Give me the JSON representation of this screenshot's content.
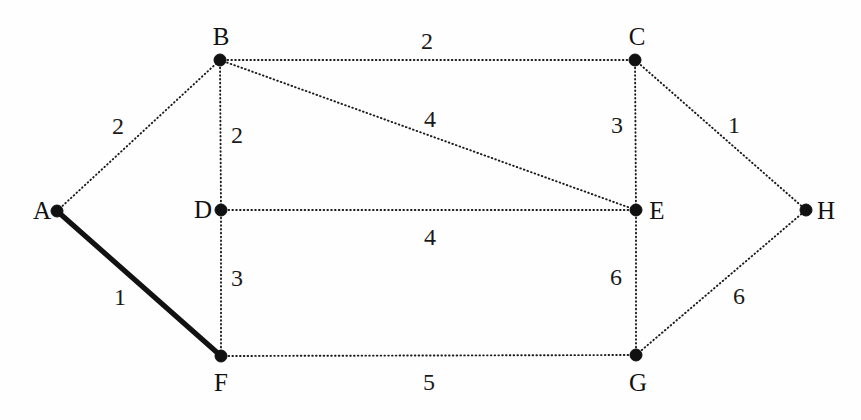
{
  "diagram": {
    "type": "graph",
    "width": 861,
    "height": 420,
    "background_color": "#fefefe",
    "ink_color": "#111111"
  },
  "chart_data": {
    "type": "diagram",
    "nodes": [
      {
        "id": "A",
        "label": "A",
        "x": 57,
        "y": 211,
        "label_x": 42,
        "label_y": 210
      },
      {
        "id": "B",
        "label": "B",
        "x": 220,
        "y": 60,
        "label_x": 221,
        "label_y": 36
      },
      {
        "id": "C",
        "label": "C",
        "x": 635,
        "y": 60,
        "label_x": 637,
        "label_y": 36
      },
      {
        "id": "D",
        "label": "D",
        "x": 221,
        "y": 210,
        "label_x": 203,
        "label_y": 209
      },
      {
        "id": "E",
        "label": "E",
        "x": 636,
        "y": 210,
        "label_x": 657,
        "label_y": 210
      },
      {
        "id": "F",
        "label": "F",
        "x": 221,
        "y": 356,
        "label_x": 221,
        "label_y": 382
      },
      {
        "id": "G",
        "label": "G",
        "x": 636,
        "y": 355,
        "label_x": 638,
        "label_y": 382
      },
      {
        "id": "H",
        "label": "H",
        "x": 806,
        "y": 210,
        "label_x": 826,
        "label_y": 210
      }
    ],
    "edges": [
      {
        "from": "A",
        "to": "B",
        "weight": "2",
        "style": "dotted",
        "label_x": 118,
        "label_y": 126
      },
      {
        "from": "A",
        "to": "F",
        "weight": "1",
        "style": "solid",
        "label_x": 120,
        "label_y": 297
      },
      {
        "from": "B",
        "to": "C",
        "weight": "2",
        "style": "dotted",
        "label_x": 427,
        "label_y": 41
      },
      {
        "from": "B",
        "to": "D",
        "weight": "2",
        "style": "dotted",
        "label_x": 237,
        "label_y": 135
      },
      {
        "from": "B",
        "to": "E",
        "weight": "4",
        "style": "dotted",
        "label_x": 430,
        "label_y": 119
      },
      {
        "from": "C",
        "to": "E",
        "weight": "3",
        "style": "dotted",
        "label_x": 617,
        "label_y": 125
      },
      {
        "from": "C",
        "to": "H",
        "weight": "1",
        "style": "dotted",
        "label_x": 734,
        "label_y": 125
      },
      {
        "from": "D",
        "to": "E",
        "weight": "4",
        "style": "dotted",
        "label_x": 430,
        "label_y": 237
      },
      {
        "from": "D",
        "to": "F",
        "weight": "3",
        "style": "dotted",
        "label_x": 237,
        "label_y": 278
      },
      {
        "from": "E",
        "to": "G",
        "weight": "6",
        "style": "dotted",
        "label_x": 616,
        "label_y": 277
      },
      {
        "from": "F",
        "to": "G",
        "weight": "5",
        "style": "dotted",
        "label_x": 429,
        "label_y": 382
      },
      {
        "from": "G",
        "to": "H",
        "weight": "6",
        "style": "dotted",
        "label_x": 739,
        "label_y": 296
      }
    ],
    "highlighted_edge": "A-F",
    "node_radius": 6
  }
}
